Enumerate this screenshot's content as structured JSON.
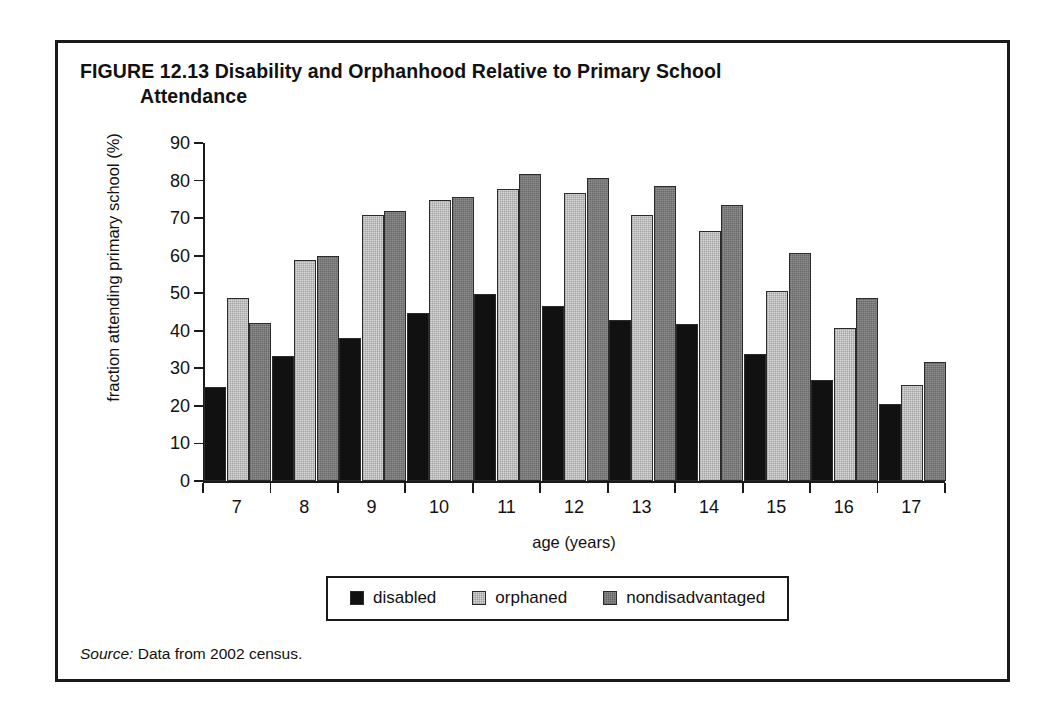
{
  "figure": {
    "number_label": "FIGURE 12.13",
    "title_line1": "Disability and Orphanhood Relative to Primary School",
    "title_line2": "Attendance",
    "source_prefix": "Source:",
    "source_text": "Data from 2002 census."
  },
  "legend": {
    "position": "bottom-center",
    "entries": [
      {
        "label": "disabled",
        "color": "#111111",
        "swatch": "filled-black-square-icon"
      },
      {
        "label": "orphaned",
        "color": "#d9d9d9",
        "swatch": "light-gray-square-icon"
      },
      {
        "label": "nondisadvantaged",
        "color": "#8f8f8f",
        "swatch": "medium-gray-square-icon"
      }
    ]
  },
  "chart_data": {
    "type": "bar",
    "title": "FIGURE 12.13 Disability and Orphanhood Relative to Primary School Attendance",
    "xlabel": "age (years)",
    "ylabel": "fraction attending primary school (%)",
    "categories": [
      "7",
      "8",
      "9",
      "10",
      "11",
      "12",
      "13",
      "14",
      "15",
      "16",
      "17"
    ],
    "series": [
      {
        "name": "disabled",
        "color": "#111111",
        "values": [
          25.1,
          33.2,
          38.0,
          44.8,
          49.8,
          46.6,
          42.8,
          41.8,
          33.8,
          26.8,
          20.6
        ]
      },
      {
        "name": "orphaned",
        "color": "#d9d9d9",
        "values": [
          48.8,
          58.8,
          70.8,
          74.8,
          77.8,
          76.6,
          70.8,
          66.6,
          50.6,
          40.8,
          25.6
        ]
      },
      {
        "name": "nondisadvantaged",
        "color": "#8f8f8f",
        "values": [
          42.0,
          59.8,
          71.8,
          75.6,
          81.8,
          80.6,
          78.6,
          73.4,
          60.6,
          48.6,
          31.6
        ]
      }
    ],
    "ylim": [
      0,
      90
    ],
    "yticks": [
      0,
      10,
      20,
      30,
      40,
      50,
      60,
      70,
      80,
      90
    ],
    "ytick_labels": [
      "0",
      "10",
      "20",
      "30",
      "40",
      "50",
      "60",
      "70",
      "80",
      "90"
    ],
    "grid": false,
    "legend": [
      "disabled",
      "orphaned",
      "nondisadvantaged"
    ],
    "legend_position": "bottom-center",
    "bar_texture": "halftone-dither"
  }
}
